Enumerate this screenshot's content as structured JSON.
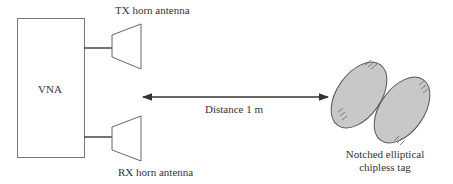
{
  "diagram": {
    "vna": {
      "label": "VNA"
    },
    "tx_antenna": {
      "label": "TX horn antenna"
    },
    "rx_antenna": {
      "label": "RX horn antenna"
    },
    "distance": {
      "label": "Distance 1 m"
    },
    "tag": {
      "label_line1": "Notched elliptical",
      "label_line2": "chipless tag"
    },
    "colors": {
      "stroke": "#555555",
      "tag_fill": "#c8c8c8",
      "text": "#333333"
    }
  }
}
